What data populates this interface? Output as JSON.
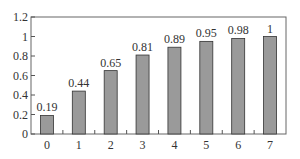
{
  "chart_data": {
    "type": "bar",
    "title": "",
    "xlabel": "",
    "ylabel": "",
    "categories": [
      "0",
      "1",
      "2",
      "3",
      "4",
      "5",
      "6",
      "7"
    ],
    "values": [
      0.19,
      0.44,
      0.65,
      0.81,
      0.89,
      0.95,
      0.98,
      1
    ],
    "data_labels": [
      "0.19",
      "0.44",
      "0.65",
      "0.81",
      "0.89",
      "0.95",
      "0.98",
      "1"
    ],
    "ylim": [
      0,
      1.2
    ],
    "yticks": [
      0,
      0.2,
      0.4,
      0.6,
      0.8,
      1,
      1.2
    ],
    "ytick_labels": [
      "0",
      "0.2",
      "0.4",
      "0.6",
      "0.8",
      "1",
      "1.2"
    ],
    "grid": false,
    "legend": null,
    "bar_color": "#9a9a9a",
    "bar_edge_color": "#333333",
    "axis_color": "#555555"
  }
}
